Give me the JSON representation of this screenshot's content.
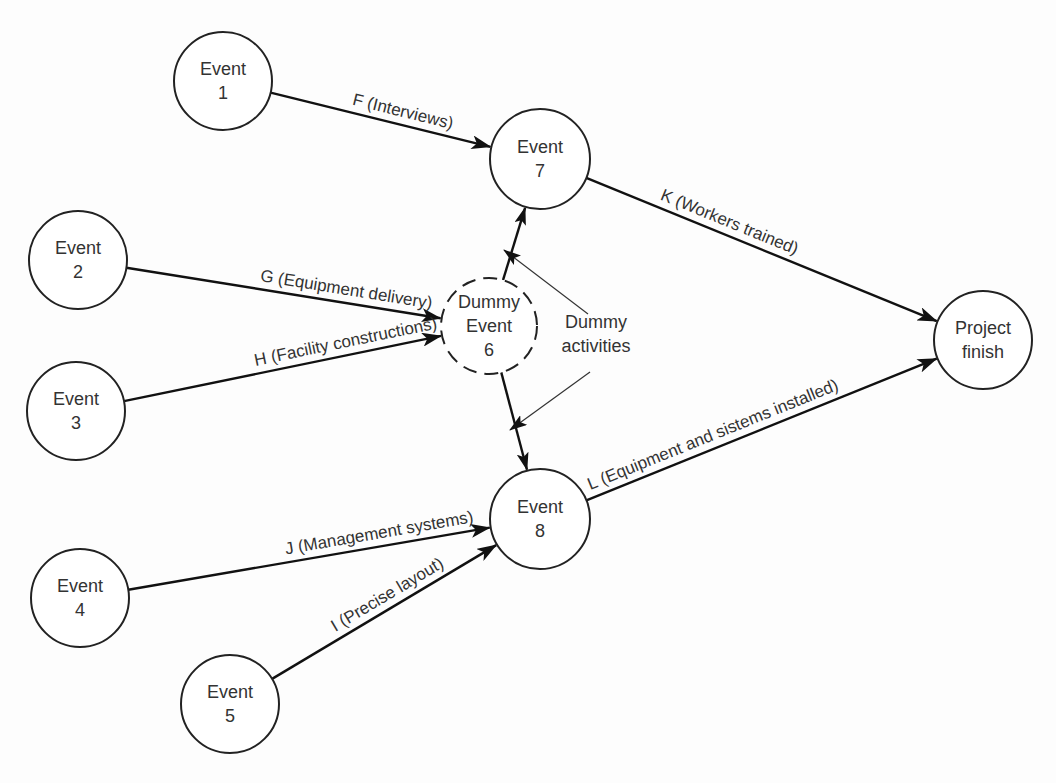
{
  "diagram": {
    "type": "activity-on-arrow network",
    "nodes": [
      {
        "id": "e1",
        "lines": [
          "Event",
          "1"
        ],
        "x": 223,
        "y": 81,
        "r": 49,
        "dashed": false
      },
      {
        "id": "e2",
        "lines": [
          "Event",
          "2"
        ],
        "x": 78,
        "y": 260,
        "r": 49,
        "dashed": false
      },
      {
        "id": "e3",
        "lines": [
          "Event",
          "3"
        ],
        "x": 76,
        "y": 411,
        "r": 49,
        "dashed": false
      },
      {
        "id": "e4",
        "lines": [
          "Event",
          "4"
        ],
        "x": 80,
        "y": 598,
        "r": 49,
        "dashed": false
      },
      {
        "id": "e5",
        "lines": [
          "Event",
          "5"
        ],
        "x": 230,
        "y": 704,
        "r": 49,
        "dashed": false
      },
      {
        "id": "e6",
        "lines": [
          "Dummy",
          "Event",
          "6"
        ],
        "x": 489,
        "y": 326,
        "r": 48,
        "dashed": true
      },
      {
        "id": "e7",
        "lines": [
          "Event",
          "7"
        ],
        "x": 540,
        "y": 159,
        "r": 50,
        "dashed": false
      },
      {
        "id": "e8",
        "lines": [
          "Event",
          "8"
        ],
        "x": 540,
        "y": 519,
        "r": 50,
        "dashed": false
      },
      {
        "id": "finish",
        "lines": [
          "Project",
          "finish"
        ],
        "x": 983,
        "y": 340,
        "r": 49,
        "dashed": false
      }
    ],
    "edges": [
      {
        "id": "F",
        "from": "e1",
        "to": "e7",
        "label": "F (Interviews)",
        "label_t": 0.36,
        "label_offset": -8
      },
      {
        "id": "G",
        "from": "e2",
        "to": "e6",
        "label": "G (Equipment delivery)",
        "label_t": 0.42,
        "label_offset": -8
      },
      {
        "id": "H",
        "from": "e3",
        "to": "e6",
        "label": "H (Facility constructions)",
        "label_t": 0.42,
        "label_offset": -8
      },
      {
        "id": "J",
        "from": "e4",
        "to": "e8",
        "label": "J (Management systems)",
        "label_t": 0.44,
        "label_offset": -8
      },
      {
        "id": "I",
        "from": "e5",
        "to": "e8",
        "label": "I (Precise layout)",
        "label_t": 0.3,
        "label_offset": -8
      },
      {
        "id": "K",
        "from": "e7",
        "to": "finish",
        "label": "K (Workers trained)",
        "label_t": 0.2,
        "label_offset": -8
      },
      {
        "id": "L",
        "from": "e8",
        "to": "finish",
        "label": "L (Equipment and sistems installed)",
        "label_t": 0.02,
        "label_offset": -8
      },
      {
        "id": "D1",
        "from": "e6",
        "to": "e7",
        "label": "",
        "dummy": true
      },
      {
        "id": "D2",
        "from": "e6",
        "to": "e8",
        "label": "",
        "dummy": true
      }
    ],
    "annotation": {
      "lines": [
        "Dummy",
        "activities"
      ],
      "x": 596,
      "y": 340,
      "pointers": [
        {
          "from": [
            588,
            314
          ],
          "to": [
            504,
            250
          ]
        },
        {
          "from": [
            590,
            372
          ],
          "to": [
            510,
            430
          ]
        }
      ]
    }
  }
}
